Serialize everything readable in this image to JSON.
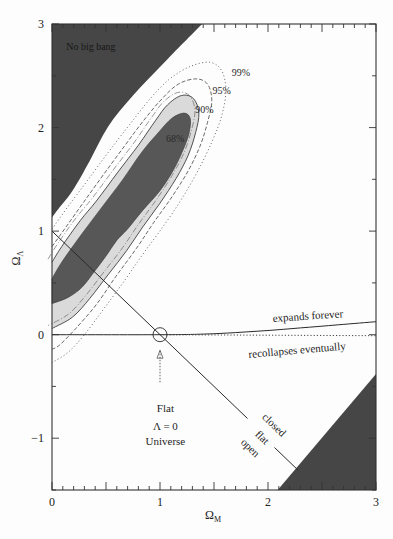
{
  "chart_data": {
    "type": "contour",
    "title": "",
    "xlabel": "Ω_M",
    "ylabel": "Ω_Λ",
    "xlim": [
      0,
      3
    ],
    "ylim": [
      -1.5,
      3
    ],
    "grid": false,
    "legend": null,
    "x_ticks": [
      0,
      1,
      2,
      3
    ],
    "y_ticks": [
      -1,
      0,
      1,
      2,
      3
    ],
    "x_minor_step": 0.1,
    "x_major_step": 0.5,
    "y_minor_step": 0.5,
    "excluded_regions": [
      {
        "name": "No big bang",
        "straight": [
          [
            0,
            3
          ],
          [
            1.39,
            3
          ]
        ],
        "curve": [
          [
            1.39,
            3
          ],
          [
            1.06,
            2.65
          ],
          [
            0.75,
            2.31
          ],
          [
            0.52,
            2.01
          ],
          [
            0.35,
            1.68
          ],
          [
            0.19,
            1.39
          ],
          [
            0.07,
            1.23
          ],
          [
            0,
            1.13
          ]
        ]
      },
      {
        "name": "lower-right excluded region",
        "straight": [
          [
            2.09,
            -1.5
          ],
          [
            3,
            -0.38
          ],
          [
            3,
            -1.5
          ]
        ],
        "curve": []
      }
    ],
    "contours": [
      {
        "level": "99%",
        "style": "dotted",
        "points": [
          [
            0.0,
            1.02
          ],
          [
            0.15,
            1.24
          ],
          [
            0.33,
            1.49
          ],
          [
            0.52,
            1.76
          ],
          [
            0.72,
            2.03
          ],
          [
            0.91,
            2.28
          ],
          [
            1.09,
            2.47
          ],
          [
            1.28,
            2.59
          ],
          [
            1.46,
            2.63
          ],
          [
            1.57,
            2.55
          ],
          [
            1.61,
            2.36
          ],
          [
            1.57,
            2.11
          ],
          [
            1.48,
            1.86
          ],
          [
            1.35,
            1.58
          ],
          [
            1.2,
            1.31
          ],
          [
            1.04,
            1.06
          ],
          [
            0.85,
            0.79
          ],
          [
            0.67,
            0.52
          ],
          [
            0.48,
            0.25
          ],
          [
            0.3,
            0.0
          ],
          [
            0.15,
            -0.17
          ],
          [
            0.0,
            -0.27
          ]
        ]
      },
      {
        "level": "95%",
        "style": "dashed",
        "points": [
          [
            0.0,
            0.85
          ],
          [
            0.13,
            1.04
          ],
          [
            0.3,
            1.29
          ],
          [
            0.48,
            1.55
          ],
          [
            0.67,
            1.82
          ],
          [
            0.85,
            2.07
          ],
          [
            1.02,
            2.28
          ],
          [
            1.17,
            2.42
          ],
          [
            1.33,
            2.47
          ],
          [
            1.44,
            2.42
          ],
          [
            1.48,
            2.26
          ],
          [
            1.44,
            2.05
          ],
          [
            1.37,
            1.82
          ],
          [
            1.26,
            1.58
          ],
          [
            1.11,
            1.33
          ],
          [
            0.94,
            1.08
          ],
          [
            0.78,
            0.83
          ],
          [
            0.59,
            0.56
          ],
          [
            0.41,
            0.29
          ],
          [
            0.22,
            0.06
          ],
          [
            0.07,
            -0.1
          ],
          [
            0.0,
            -0.14
          ]
        ]
      },
      {
        "level": "90%",
        "style": "filled-light",
        "points": [
          [
            0.0,
            0.7
          ],
          [
            0.09,
            0.85
          ],
          [
            0.26,
            1.1
          ],
          [
            0.41,
            1.29
          ],
          [
            0.61,
            1.57
          ],
          [
            0.8,
            1.83
          ],
          [
            0.96,
            2.07
          ],
          [
            1.07,
            2.22
          ],
          [
            1.2,
            2.31
          ],
          [
            1.31,
            2.28
          ],
          [
            1.36,
            2.14
          ],
          [
            1.33,
            1.95
          ],
          [
            1.26,
            1.73
          ],
          [
            1.15,
            1.51
          ],
          [
            1.0,
            1.27
          ],
          [
            0.84,
            1.04
          ],
          [
            0.69,
            0.81
          ],
          [
            0.52,
            0.58
          ],
          [
            0.35,
            0.35
          ],
          [
            0.19,
            0.17
          ],
          [
            0.0,
            0.06
          ]
        ]
      },
      {
        "level": "68%",
        "style": "filled-dark",
        "points": [
          [
            0.0,
            0.54
          ],
          [
            0.09,
            0.7
          ],
          [
            0.26,
            0.95
          ],
          [
            0.44,
            1.2
          ],
          [
            0.65,
            1.49
          ],
          [
            0.83,
            1.76
          ],
          [
            1.0,
            1.97
          ],
          [
            1.11,
            2.09
          ],
          [
            1.22,
            2.14
          ],
          [
            1.28,
            2.09
          ],
          [
            1.27,
            1.95
          ],
          [
            1.22,
            1.8
          ],
          [
            1.13,
            1.6
          ],
          [
            1.0,
            1.39
          ],
          [
            0.84,
            1.2
          ],
          [
            0.7,
            1.02
          ],
          [
            0.6,
            0.91
          ],
          [
            0.5,
            0.76
          ],
          [
            0.4,
            0.62
          ],
          [
            0.28,
            0.46
          ],
          [
            0.15,
            0.36
          ],
          [
            0.0,
            0.3
          ]
        ]
      }
    ],
    "lines": [
      {
        "name": "flat-universe-line",
        "style": "solid",
        "segments": [
          [
            [
              0,
              1
            ],
            [
              1.81,
              -0.81
            ]
          ],
          [
            [
              2.06,
              -1.09
            ],
            [
              2.28,
              -1.31
            ]
          ]
        ]
      },
      {
        "name": "expansion-boundary-line",
        "style": "solid",
        "smooth": true,
        "points": [
          [
            0,
            0
          ],
          [
            1,
            0
          ],
          [
            1.4,
            0.005
          ],
          [
            1.7,
            0.02
          ],
          [
            2.0,
            0.04
          ],
          [
            2.3,
            0.065
          ],
          [
            2.65,
            0.095
          ],
          [
            3,
            0.125
          ]
        ]
      },
      {
        "name": "recollapse-boundary-line",
        "style": "dotted",
        "points": [
          [
            1,
            0
          ],
          [
            3,
            -0.01
          ]
        ]
      }
    ],
    "marker": {
      "shape": "circle",
      "x": 1,
      "y": 0,
      "radius_px": 7
    },
    "arrow": {
      "from": [
        1,
        -0.46
      ],
      "to": [
        1,
        -0.15
      ],
      "style": "dotted"
    },
    "annotations": [
      {
        "text": "No big bang",
        "x": 0.36,
        "y": 2.77,
        "rotate": 0,
        "cls": "anno-dark"
      },
      {
        "text": "99%",
        "x": 1.75,
        "y": 2.52,
        "rotate": 0,
        "cls": "anno-small"
      },
      {
        "text": "95%",
        "x": 1.57,
        "y": 2.35,
        "rotate": 0,
        "cls": "anno-small"
      },
      {
        "text": "90%",
        "x": 1.41,
        "y": 2.16,
        "rotate": 0,
        "cls": "anno-small"
      },
      {
        "text": "68%",
        "x": 1.14,
        "y": 1.88,
        "rotate": 0,
        "cls": "anno-small"
      },
      {
        "text": "expands forever",
        "x": 2.37,
        "y": 0.17,
        "rotate": -4,
        "cls": "anno"
      },
      {
        "text": "recollapses eventually",
        "x": 2.27,
        "y": -0.16,
        "rotate": -5,
        "cls": "anno"
      },
      {
        "text": "closed",
        "x": 2.05,
        "y": -0.88,
        "rotate": 44,
        "cls": "anno"
      },
      {
        "text": "flat",
        "x": 1.94,
        "y": -1.0,
        "rotate": 44,
        "cls": "anno"
      },
      {
        "text": "open",
        "x": 1.83,
        "y": -1.1,
        "rotate": 44,
        "cls": "anno"
      },
      {
        "text": "Flat",
        "x": 1.05,
        "y": -0.72,
        "rotate": 0,
        "cls": "anno"
      },
      {
        "text": "Λ = 0",
        "x": 1.05,
        "y": -0.9,
        "rotate": 0,
        "cls": "anno"
      },
      {
        "text": "Universe",
        "x": 1.05,
        "y": -1.04,
        "rotate": 0,
        "cls": "anno"
      }
    ],
    "colors": {
      "excluded": "#464646",
      "fill_68": "#575757",
      "fill_90": "#dadada",
      "line": "#2a2a2a",
      "frame": "#333333"
    }
  }
}
